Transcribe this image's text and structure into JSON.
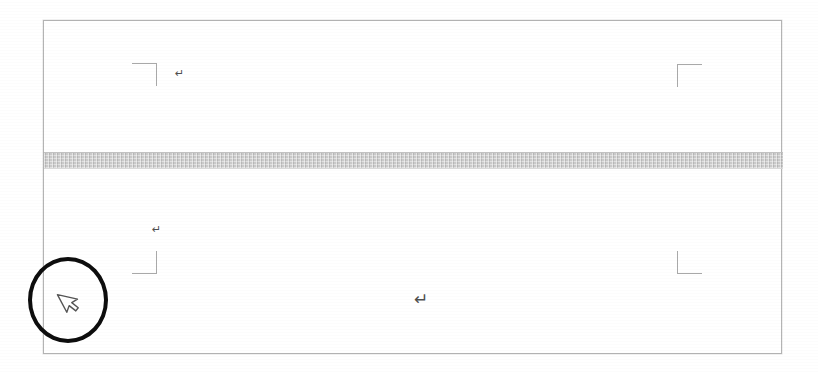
{
  "figure": {
    "kind": "word-processor-page-screenshot",
    "background_color": "#ffffff"
  },
  "document_page": {
    "name": "document-page",
    "border_color": "#b4b4b4",
    "fill_color": "#ffffff"
  },
  "page_break_band": {
    "name": "page-break-band",
    "label": "",
    "fill_color": "#c9c9c9"
  },
  "margin_markers": [
    {
      "name": "margin-marker-top-left",
      "corner": "top-left",
      "glyph": "┐",
      "color": "#a9a9a9"
    },
    {
      "name": "margin-marker-top-right",
      "corner": "top-right",
      "glyph": "┌",
      "color": "#a9a9a9"
    },
    {
      "name": "margin-marker-bottom-left",
      "corner": "bottom-left",
      "glyph": "┘",
      "color": "#a9a9a9"
    },
    {
      "name": "margin-marker-bottom-right",
      "corner": "bottom-right",
      "glyph": "└",
      "color": "#a9a9a9"
    }
  ],
  "paragraph_marks": [
    {
      "name": "paragraph-mark-page1-first",
      "glyph": "↵",
      "size": "small"
    },
    {
      "name": "paragraph-mark-page2-first",
      "glyph": "↵",
      "size": "small"
    },
    {
      "name": "paragraph-mark-page2-body",
      "glyph": "↵",
      "size": "large"
    }
  ],
  "annotation": {
    "name": "annotation-ellipse",
    "shape": "ellipse",
    "stroke_color": "#0d0d0d",
    "label": ""
  },
  "cursor": {
    "name": "mouse-pointer",
    "type": "arrow-pointer",
    "fill_color": "#ffffff",
    "stroke_color": "#555555"
  }
}
